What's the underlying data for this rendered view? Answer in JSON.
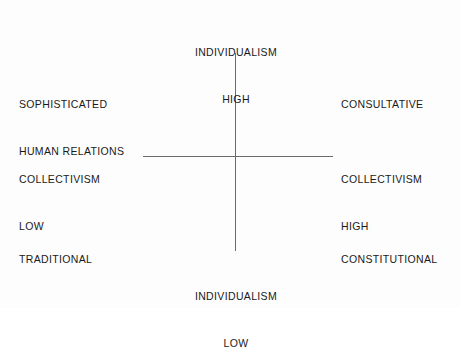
{
  "diagram": {
    "type": "quadrant-matrix",
    "background_color": "#fdfdfd",
    "line_color": "#6b6b6b",
    "text_color": "#1a1a1a",
    "axes": {
      "vertical": {
        "name": "INDIVIDUALISM",
        "top_label_line1": "INDIVIDUALISM",
        "top_label_line2": "HIGH",
        "bottom_label_line1": "INDIVIDUALISM",
        "bottom_label_line2": "LOW"
      },
      "horizontal": {
        "name": "COLLECTIVISM",
        "left_label_line1": "COLLECTIVISM",
        "left_label_line2": "LOW",
        "right_label_line1": "COLLECTIVISM",
        "right_label_line2": "HIGH"
      }
    },
    "quadrants": [
      {
        "position": "top-left",
        "label_line1": "SOPHISTICATED",
        "label_line2": "HUMAN RELATIONS"
      },
      {
        "position": "top-right",
        "label_line1": "CONSULTATIVE",
        "label_line2": ""
      },
      {
        "position": "bottom-left",
        "label_line1": "TRADITIONAL",
        "label_line2": ""
      },
      {
        "position": "bottom-right",
        "label_line1": "CONSTITUTIONAL",
        "label_line2": ""
      }
    ]
  }
}
